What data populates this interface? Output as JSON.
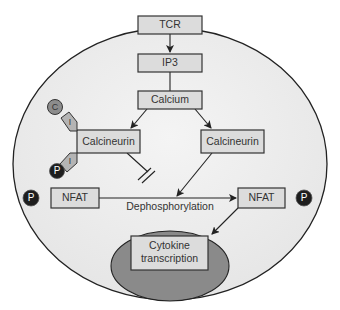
{
  "diagram": {
    "nodes": {
      "tcr": "TCR",
      "ip3": "IP3",
      "calcium": "Calcium",
      "calcineurin_left": "Calcineurin",
      "calcineurin_right": "Calcineurin",
      "nfat_left": "NFAT",
      "nfat_right": "NFAT",
      "cytokine_line1": "Cytokine",
      "cytokine_line2": "transcription"
    },
    "labels": {
      "dephosphorylation": "Dephosphorylation"
    },
    "markers": {
      "cyclophilin": "C",
      "immunophilin_top": "I",
      "immunophilin_bottom": "I",
      "phosphate_inhibitor": "P",
      "phosphate_left": "P",
      "phosphate_right": "P"
    },
    "edges": [
      {
        "from": "TCR",
        "to": "IP3",
        "type": "arrow"
      },
      {
        "from": "IP3",
        "to": "Calcium",
        "type": "line"
      },
      {
        "from": "Calcium",
        "to": "Calcineurin (left)",
        "type": "arrow"
      },
      {
        "from": "Calcium",
        "to": "Calcineurin (right)",
        "type": "arrow"
      },
      {
        "from": "Calcineurin (left)",
        "to": "Dephosphorylation",
        "type": "inhibition"
      },
      {
        "from": "Calcineurin (right)",
        "to": "Dephosphorylation",
        "type": "arrow"
      },
      {
        "from": "NFAT (left)",
        "to": "NFAT (right)",
        "type": "arrow"
      },
      {
        "from": "NFAT (right)",
        "to": "Cytokine transcription",
        "type": "arrow"
      }
    ],
    "colors": {
      "cell": "#ececec",
      "nucleus": "#8a8a8a",
      "box": "#dcdcdc",
      "phosphate": "#1e1e1e",
      "cyclophilin": "#8c8c8c",
      "immunophilin": "#b4b4b4"
    }
  }
}
